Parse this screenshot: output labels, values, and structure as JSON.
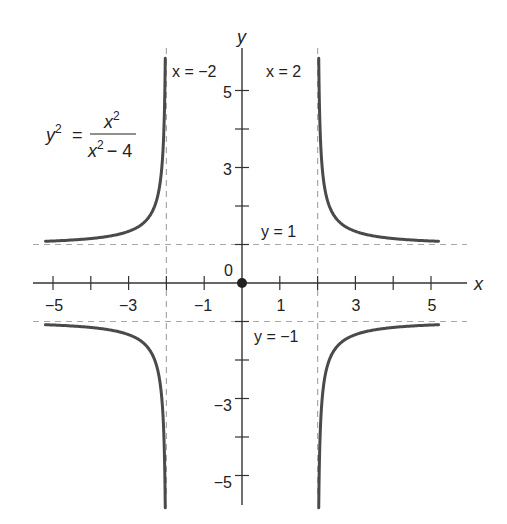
{
  "chart_data": {
    "type": "line",
    "title": "",
    "equation": {
      "lhs_base": "y",
      "lhs_exp": "2",
      "equals": "=",
      "num_base": "x",
      "num_exp": "2",
      "den_base": "x",
      "den_exp": "2",
      "den_rest": "− 4"
    },
    "xlabel": "x",
    "ylabel": "y",
    "xlim": [
      -5.5,
      6
    ],
    "ylim": [
      -6,
      6
    ],
    "grid": false,
    "x_tick_labels": [
      "−5",
      "−3",
      "−1",
      "1",
      "3",
      "5"
    ],
    "x_tick_values": [
      -5,
      -4,
      -3,
      -2,
      -1,
      1,
      2,
      3,
      4,
      5
    ],
    "y_tick_labels": [
      "5",
      "3",
      "−3",
      "−5"
    ],
    "y_tick_values": [
      5,
      4,
      3,
      2,
      1,
      -1,
      -2,
      -3,
      -4,
      -5
    ],
    "origin_label": "0",
    "asymptotes": [
      {
        "type": "vertical",
        "value": -2,
        "label": "x = −2"
      },
      {
        "type": "vertical",
        "value": 2,
        "label": "x = 2"
      },
      {
        "type": "horizontal",
        "value": 1,
        "label": "y = 1"
      },
      {
        "type": "horizontal",
        "value": -1,
        "label": "y = −1"
      }
    ],
    "series": [
      {
        "name": "upper-right branch",
        "function": "y = x/sqrt(x^2-4)",
        "x_range": [
          2.03,
          5.2
        ],
        "sign": 1,
        "side": 1
      },
      {
        "name": "lower-right branch",
        "function": "y = -x/sqrt(x^2-4)",
        "x_range": [
          2.03,
          5.2
        ],
        "sign": -1,
        "side": 1
      },
      {
        "name": "upper-left branch",
        "function": "y = -x/sqrt(x^2-4)",
        "x_range": [
          -5.2,
          -2.03
        ],
        "sign": 1,
        "side": -1
      },
      {
        "name": "lower-left branch",
        "function": "y = x/sqrt(x^2-4)",
        "x_range": [
          -5.2,
          -2.03
        ],
        "sign": -1,
        "side": -1
      }
    ],
    "sample_points": [
      {
        "x": 2.03,
        "y": 5.9
      },
      {
        "x": 2.5,
        "y": 1.67
      },
      {
        "x": 3,
        "y": 1.34
      },
      {
        "x": 4,
        "y": 1.15
      },
      {
        "x": 5,
        "y": 1.09
      },
      {
        "x": 5.2,
        "y": 1.08
      }
    ],
    "colors": {
      "curve": "#4a4a4a",
      "axis": "#333333",
      "asymptote": "#a8a8a8",
      "origin_point": "#222222"
    }
  }
}
